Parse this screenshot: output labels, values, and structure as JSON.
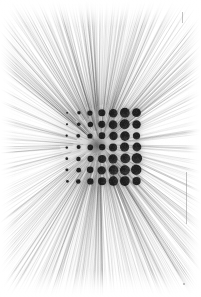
{
  "artwork": {
    "title": "Radial Line Burst with Graduated Dot Grid",
    "medium_note": "monochrome print",
    "background_color": "#ffffff",
    "ink_color": "#111111",
    "canvas": {
      "width": 201,
      "height": 297
    },
    "margin": 7
  },
  "burst": {
    "center": {
      "x": 100,
      "y": 145
    },
    "ray_count": 900,
    "ray_color": "#2b2b2b",
    "inner_radius": 30,
    "outer_radius": 330,
    "min_opacity": 0.05,
    "max_opacity": 0.34,
    "min_width": 0.25,
    "max_width": 0.8,
    "angle_jitter": 0.055,
    "density_bias_vertical": 0.62
  },
  "grid": {
    "label": "dot-grid",
    "columns": 7,
    "rows": 7,
    "origin": {
      "x": 67,
      "y": 113
    },
    "spacing_x": 11.6,
    "spacing_y": 11.4,
    "dot_color": "#151515",
    "min_radius": 0.9,
    "max_radius": 5.2,
    "radii": [
      [
        0.9,
        1.7,
        2.6,
        3.5,
        4.3,
        4.9,
        4.4
      ],
      [
        1.0,
        1.8,
        2.7,
        3.6,
        4.4,
        5.0,
        4.2
      ],
      [
        1.1,
        1.9,
        2.6,
        3.4,
        4.2,
        4.8,
        3.6
      ],
      [
        1.2,
        2.0,
        2.8,
        3.2,
        4.0,
        4.6,
        4.4
      ],
      [
        1.3,
        2.2,
        3.1,
        4.0,
        4.6,
        4.9,
        5.2
      ],
      [
        1.4,
        2.4,
        3.3,
        4.2,
        4.8,
        5.0,
        5.2
      ],
      [
        1.3,
        2.3,
        3.2,
        4.1,
        4.7,
        4.9,
        4.1
      ]
    ]
  },
  "smudge": {
    "label": "center-convergence-smudge",
    "x": 97,
    "y": 146,
    "radius": 13,
    "opacity": 0.55,
    "color": "#1a1a1a"
  },
  "edge_marks": [
    {
      "name": "top-right-tick",
      "x": 182,
      "y": 12,
      "width": 1,
      "height": 11
    },
    {
      "name": "right-margin-rule",
      "x": 186,
      "y": 172,
      "width": 1,
      "height": 52
    },
    {
      "name": "bottom-right-speck",
      "x": 183,
      "y": 283,
      "width": 2,
      "height": 2
    }
  ],
  "corner_marks": [
    {
      "name": "top-right-registration",
      "text": "",
      "x": 186,
      "y": 10
    }
  ]
}
